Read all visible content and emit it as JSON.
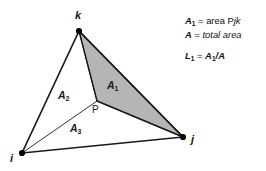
{
  "diagram": {
    "type": "triangle-area-coordinates",
    "vertices": [
      {
        "id": "k",
        "label": "k",
        "x": 79,
        "y": 31
      },
      {
        "id": "i",
        "label": "i",
        "x": 22,
        "y": 153
      },
      {
        "id": "j",
        "label": "j",
        "x": 183,
        "y": 137
      }
    ],
    "interior_point": {
      "id": "P",
      "label": "P",
      "x": 97,
      "y": 101
    },
    "sub_areas": [
      {
        "id": "A1",
        "label": "A",
        "subscript": "1",
        "x": 112,
        "y": 85,
        "shaded": true,
        "triangle": "P j k"
      },
      {
        "id": "A2",
        "label": "A",
        "subscript": "2",
        "x": 63,
        "y": 95,
        "shaded": false,
        "triangle": "P k i"
      },
      {
        "id": "A3",
        "label": "A",
        "subscript": "3",
        "x": 75,
        "y": 128,
        "shaded": false,
        "triangle": "P i j"
      }
    ],
    "colors": {
      "shaded_fill": "#b5b5b5",
      "stroke": "#1a1a1a",
      "vertex_dot": "#000000",
      "background": "#ffffff"
    }
  },
  "legend": {
    "line1": {
      "symbol": "A",
      "subscript": "1",
      "equals": "=",
      "text_plain": "area P",
      "text_italic": "jk"
    },
    "line2": {
      "symbol": "A",
      "subscript": "",
      "equals": "=",
      "text_plain": "",
      "text_italic": "total area"
    },
    "line3": {
      "symbol": "L",
      "subscript": "1",
      "equals": "=",
      "numer": "A",
      "numer_sub": "1",
      "slash": "/",
      "denom": "A"
    }
  }
}
